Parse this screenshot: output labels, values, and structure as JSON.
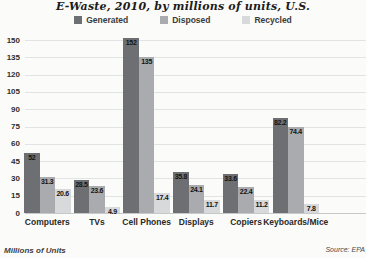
{
  "header": {
    "title": "E-Waste, 2010, by millions of units, U.S."
  },
  "chart_data": {
    "type": "bar",
    "title": "E-Waste, 2010, by millions of units, U.S.",
    "categories": [
      "Computers",
      "TVs",
      "Cell Phones",
      "Displays",
      "Copiers",
      "Keyboards/Mice"
    ],
    "series": [
      {
        "name": "Generated",
        "color": "#6e6f72",
        "values": [
          52,
          28.5,
          152,
          35.8,
          33.6,
          82.2
        ]
      },
      {
        "name": "Disposed",
        "color": "#a9abae",
        "values": [
          31.3,
          23.6,
          135,
          24.1,
          22.4,
          74.4
        ]
      },
      {
        "name": "Recycled",
        "color": "#d8d9da",
        "values": [
          20.6,
          4.9,
          17.4,
          11.7,
          11.2,
          7.8
        ]
      }
    ],
    "ylim": [
      0,
      150
    ],
    "ytick_step": 15,
    "grid": true,
    "legend_position": "top",
    "units": "Millions of Units",
    "footer_left": "Millions of Units",
    "footer_right": "Source: EPA"
  }
}
